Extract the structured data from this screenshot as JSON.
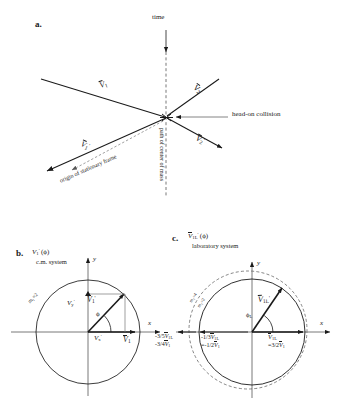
{
  "figure": {
    "panels": [
      {
        "id": "a",
        "letter": "a.",
        "labels": {
          "time": "time",
          "head_on_collision": "head-on collision",
          "origin_stationary_frame": "origin of stationary frame",
          "path_center_of_mass": "path of center of mass"
        },
        "vectors": [
          {
            "name": "V1",
            "label_parts": {
              "symbol": "V",
              "sub": "1",
              "prime": ""
            }
          },
          {
            "name": "V2",
            "label_parts": {
              "symbol": "V",
              "sub": "2",
              "prime": ""
            }
          },
          {
            "name": "V1p",
            "label_parts": {
              "symbol": "V",
              "sub": "1",
              "prime": "'"
            }
          },
          {
            "name": "V2p",
            "label_parts": {
              "symbol": "V",
              "sub": "2",
              "prime": "'"
            }
          }
        ]
      },
      {
        "id": "b",
        "letter": "b.",
        "title_symbol": "V",
        "title_sub": "1",
        "title_prime": "'",
        "title_arg": "(ϕ)",
        "subtitle": "c.m. system",
        "axis_x": "x",
        "axis_y": "y",
        "mass_label": "m₁=2",
        "angle_label": "ϕ",
        "vec_Vyp": {
          "symbol": "V",
          "sub": "y",
          "prime": "'"
        },
        "vec_Vxp": {
          "symbol": "V",
          "sub": "x",
          "prime": "'"
        },
        "vec_V1p": {
          "symbol": "V",
          "sub": "1",
          "prime": "'"
        },
        "vec_V1": {
          "symbol": "V",
          "sub": "1",
          "prime": ""
        }
      },
      {
        "id": "c",
        "letter": "c.",
        "title_symbol": "V",
        "title_sub": "1L",
        "title_prime": "'",
        "title_arg": "(ϕ)",
        "subtitle": "laboratory system",
        "axis_x": "x",
        "axis_y": "y",
        "mass_label_outer": "m₂=4",
        "mass_label_inner": "m₂=2",
        "angle_label": "ϕ",
        "angle_sub": "L",
        "vec_V1Lp": {
          "symbol": "V",
          "sub": "1L",
          "prime": "'"
        },
        "vec_V1L": {
          "symbol": "V",
          "sub": "1L",
          "prime": ""
        },
        "value_V1L": "=3/2",
        "value_V1L_sym": "V",
        "value_V1L_sub": "1",
        "left_values": [
          {
            "coef": "-3/5",
            "symbol": "V",
            "sub": "1L"
          },
          {
            "coef": "-3/4",
            "symbol": "V",
            "sub": "1"
          },
          {
            "coef": "-1/3",
            "symbol": "V",
            "sub": "1L"
          },
          {
            "coef": "=-1/2",
            "symbol": "V",
            "sub": "1"
          }
        ]
      }
    ]
  },
  "style": {
    "line_color": "#1a1a1a",
    "dash_color": "#555555",
    "background": "#ffffff"
  }
}
